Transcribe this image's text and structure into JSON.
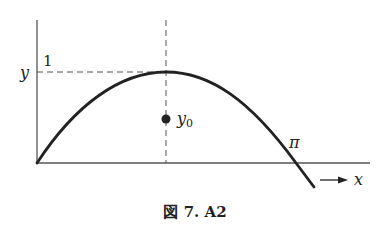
{
  "figure": {
    "caption": "図 7. A2",
    "labels": {
      "y_axis": "y",
      "one": "1",
      "y0_base": "y",
      "y0_sub": "0",
      "pi": "π",
      "x_axis": "x"
    },
    "colors": {
      "ink": "#222222",
      "axis": "#555555",
      "dash": "#555555"
    }
  }
}
